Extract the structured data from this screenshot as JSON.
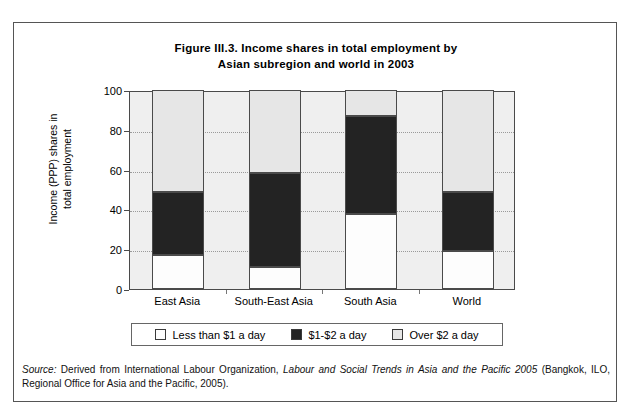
{
  "figure": {
    "title_line1": "Figure III.3. Income shares in total employment by",
    "title_line2": "Asian subregion and world in 2003",
    "ylabel_line1": "Income (PPP) shares in",
    "ylabel_line2": "total employment"
  },
  "source": {
    "label": "Source:",
    "text_before_italic": " Derived from International Labour Organization, ",
    "italic_title": "Labour and Social Trends in Asia and the Pacific 2005",
    "text_after_italic": " (Bangkok, ILO, Regional Office for Asia and the Pacific, 2005)."
  },
  "legend": {
    "items": [
      {
        "label": "Less than $1 a day",
        "color": "#fdfdfd"
      },
      {
        "label": "$1-$2 a day",
        "color": "#232323"
      },
      {
        "label": "Over $2 a day",
        "color": "#e6e6e6"
      }
    ]
  },
  "chart_data": {
    "type": "bar",
    "stacked": true,
    "title": "Figure III.3. Income shares in total employment by Asian subregion and world in 2003",
    "xlabel": "",
    "ylabel": "Income (PPP) shares in total employment",
    "ylim": [
      0,
      100
    ],
    "yticks": [
      0,
      20,
      40,
      60,
      80,
      100
    ],
    "grid": "horizontal-dotted",
    "legend_position": "bottom",
    "categories": [
      "East Asia",
      "South-East Asia",
      "South Asia",
      "World"
    ],
    "series": [
      {
        "name": "Less than $1 a day",
        "color": "#fdfdfd",
        "values": [
          17,
          11,
          37.5,
          19
        ]
      },
      {
        "name": "$1-$2 a day",
        "color": "#232323",
        "values": [
          32,
          47.5,
          49.5,
          30
        ]
      },
      {
        "name": "Over $2 a day",
        "color": "#e6e6e6",
        "values": [
          51,
          41.5,
          13,
          51
        ]
      }
    ],
    "cumulative_tops": {
      "East Asia": [
        17,
        49,
        100
      ],
      "South-East Asia": [
        11,
        58.5,
        100
      ],
      "South Asia": [
        37.5,
        87,
        100
      ],
      "World": [
        19,
        49,
        100
      ]
    }
  }
}
